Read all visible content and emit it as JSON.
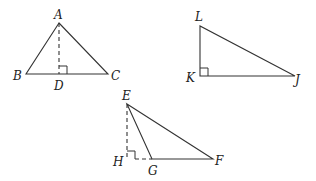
{
  "figures": [
    {
      "id": "triangle-ABC",
      "vertices": {
        "A": {
          "label": "A",
          "x": 59,
          "y": 23
        },
        "B": {
          "label": "B",
          "x": 26,
          "y": 74
        },
        "C": {
          "label": "C",
          "x": 108,
          "y": 74
        },
        "D": {
          "label": "D",
          "x": 59,
          "y": 74
        }
      },
      "altitude": "AD",
      "right_angle_at": "D"
    },
    {
      "id": "triangle-JKL",
      "vertices": {
        "L": {
          "label": "L",
          "x": 200,
          "y": 26
        },
        "K": {
          "label": "K",
          "x": 200,
          "y": 76
        },
        "J": {
          "label": "J",
          "x": 295,
          "y": 76
        }
      },
      "right_angle_at": "K"
    },
    {
      "id": "triangle-EFG",
      "vertices": {
        "E": {
          "label": "E",
          "x": 127,
          "y": 104
        },
        "H": {
          "label": "H",
          "x": 127,
          "y": 159
        },
        "G": {
          "label": "G",
          "x": 152,
          "y": 159
        },
        "F": {
          "label": "F",
          "x": 213,
          "y": 159
        }
      },
      "altitude": "EH",
      "extension": "HG",
      "right_angle_at": "H"
    }
  ],
  "labels": {
    "A": "A",
    "B": "B",
    "C": "C",
    "D": "D",
    "L": "L",
    "K": "K",
    "J": "J",
    "E": "E",
    "F": "F",
    "G": "G",
    "H": "H"
  },
  "colors": {
    "stroke": "#333333",
    "text": "#222222",
    "background": "#ffffff"
  }
}
